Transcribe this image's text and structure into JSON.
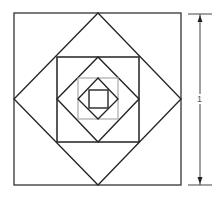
{
  "diagram": {
    "dimension_label": "1",
    "colors": {
      "stroke": "#222222",
      "gray_square": "#aaaaaa",
      "dimension": "#333333",
      "background": "#ffffff"
    },
    "shapes": [
      {
        "type": "square",
        "name": "outer-square",
        "x1": 14,
        "y1": 13,
        "x2": 181,
        "y2": 185
      },
      {
        "type": "diamond",
        "name": "diamond-1",
        "cx": 97.5,
        "cy": 99,
        "rx": 83.5,
        "ry": 86
      },
      {
        "type": "square",
        "name": "square-2",
        "x1": 57,
        "y1": 57,
        "x2": 139,
        "y2": 142
      },
      {
        "type": "diamond",
        "name": "diamond-2",
        "cx": 98,
        "cy": 99.5,
        "rx": 41,
        "ry": 42.5
      },
      {
        "type": "square",
        "name": "gray-square",
        "x1": 78,
        "y1": 78,
        "x2": 118,
        "y2": 119
      },
      {
        "type": "diamond",
        "name": "diamond-3",
        "cx": 98,
        "cy": 98.5,
        "rx": 20,
        "ry": 20.5
      },
      {
        "type": "square",
        "name": "inner-square",
        "x1": 89,
        "y1": 90,
        "x2": 108,
        "y2": 108
      }
    ],
    "dimension": {
      "x": 200,
      "y1": 14,
      "y2": 185,
      "tick_x1": 188,
      "tick_x2": 212
    }
  }
}
